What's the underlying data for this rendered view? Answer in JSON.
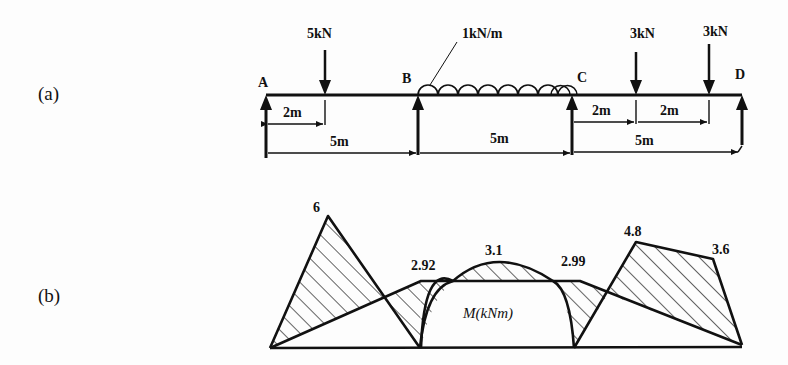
{
  "panels": {
    "a": {
      "label": "(a)"
    },
    "b": {
      "label": "(b)"
    }
  },
  "beam": {
    "supports": [
      {
        "name": "A",
        "x_m": 0
      },
      {
        "name": "B",
        "x_m": 5
      },
      {
        "name": "C",
        "x_m": 10
      },
      {
        "name": "D",
        "x_m": 15
      }
    ],
    "loads": [
      {
        "type": "point",
        "label": "5kN",
        "x_m": 2
      },
      {
        "type": "udl",
        "label": "1kN/m",
        "from_m": 5,
        "to_m": 10
      },
      {
        "type": "point",
        "label": "3kN",
        "x_m": 12
      },
      {
        "type": "point",
        "label": "3kN",
        "x_m": 14
      }
    ],
    "dimensions": {
      "a_load": "2m",
      "span_ab": "5m",
      "span_bc": "5m",
      "cd_first": "2m",
      "cd_second": "2m",
      "span_cd": "5m"
    }
  },
  "moment_diagram": {
    "axis_label": "M(kNm)",
    "values": {
      "peak_ab": "6",
      "support_b": "2.92",
      "peak_bc": "3.1",
      "support_c": "2.99",
      "load_12": "4.8",
      "load_14": "3.6"
    }
  }
}
